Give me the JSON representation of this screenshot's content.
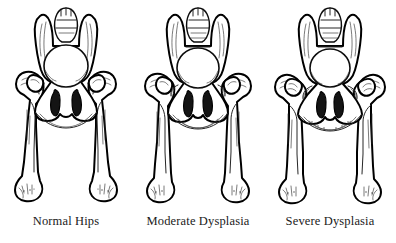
{
  "diagram": {
    "background_color": "#ffffff",
    "ink_color": "#0d0d0d",
    "caption_color": "#1a1a1a",
    "panel_count": 3,
    "panels": [
      {
        "id": "normal",
        "caption": "Normal Hips",
        "severity": "none",
        "femoral_head_seating": "deep and congruent in acetabulum",
        "joint_gap": "none",
        "femur_angle_deg": 8
      },
      {
        "id": "moderate",
        "caption": "Moderate Dysplasia",
        "severity": "moderate",
        "femoral_head_seating": "partially subluxated, shallow acetabulum",
        "joint_gap": "slight",
        "femur_angle_deg": 11
      },
      {
        "id": "severe",
        "caption": "Severe Dysplasia",
        "severity": "severe",
        "femoral_head_seating": "luxated laterally, flattened acetabulum",
        "joint_gap": "wide",
        "femur_angle_deg": 14
      }
    ],
    "anatomy_labels": [
      "sacrum",
      "iliac wing",
      "pelvic inlet",
      "obturator foramen",
      "acetabulum",
      "femoral head",
      "greater trochanter",
      "femoral shaft",
      "femoral condyles",
      "ischial tuberosity"
    ]
  }
}
